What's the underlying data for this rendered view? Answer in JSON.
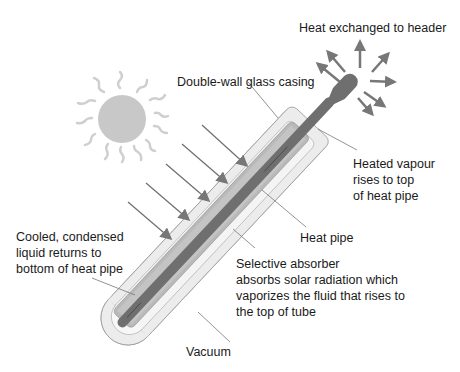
{
  "diagram": {
    "labels": {
      "heat_exchanged": "Heat exchanged to header",
      "double_wall": "Double-wall glass casing",
      "heated_vapour": "Heated vapour\nrises to top\nof heat pipe",
      "heat_pipe": "Heat pipe",
      "cooled_liquid": "Cooled, condensed\nliquid returns to\nbottom of heat pipe",
      "selective_absorber": "Selective absorber\nabsorbs solar radiation which\nvaporizes the fluid that rises to\nthe top of tube",
      "vacuum": "Vacuum"
    },
    "icons": {
      "sun": "sun-icon",
      "radiation_arrows": "solar-radiation-arrows",
      "heat_arrows": "heat-output-arrows"
    },
    "colors": {
      "outer_glass": "#ebebeb",
      "inner_glass": "#d6d6d6",
      "absorber": "#b4b4b4",
      "heat_pipe": "#707070",
      "sun": "#c8c8c8",
      "arrow": "#6e6e6e",
      "text": "#1a1a1a"
    }
  }
}
